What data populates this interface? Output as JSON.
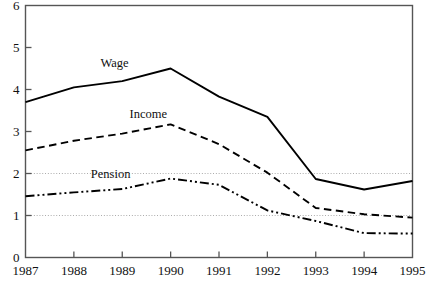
{
  "chart_data": {
    "type": "line",
    "title": "",
    "subtitle": "",
    "xlabel": "",
    "ylabel": "",
    "x": [
      1987,
      1988,
      1989,
      1990,
      1991,
      1992,
      1993,
      1994,
      1995
    ],
    "categories": [
      "1987",
      "1988",
      "1989",
      "1990",
      "1991",
      "1992",
      "1993",
      "1994",
      "1995"
    ],
    "xlim": [
      1987,
      1995
    ],
    "ylim": [
      0,
      6
    ],
    "yticks": [
      0,
      1,
      2,
      3,
      4,
      5,
      6
    ],
    "ytick_labels": [
      "0",
      "1",
      "2",
      "3",
      "4",
      "5",
      "6"
    ],
    "grid": "horizontal dotted gridlines at y=1 and y=2 only",
    "gridlines": [
      1,
      2
    ],
    "legend": "inline labels placed next to each curve",
    "legend_position": "inline",
    "series": [
      {
        "name": "Wage",
        "style": "solid",
        "color": "#000000",
        "values": [
          3.7,
          4.05,
          4.2,
          4.5,
          3.83,
          3.35,
          1.87,
          1.62,
          1.82
        ]
      },
      {
        "name": "Income",
        "style": "dashed",
        "color": "#000000",
        "values": [
          2.55,
          2.78,
          2.95,
          3.17,
          2.7,
          2.02,
          1.18,
          1.03,
          0.95
        ]
      },
      {
        "name": "Pension",
        "style": "dash-dot-dot",
        "color": "#000000",
        "values": [
          1.46,
          1.55,
          1.63,
          1.88,
          1.73,
          1.12,
          0.87,
          0.58,
          0.57
        ]
      }
    ],
    "annotations": [
      {
        "text": "Wage",
        "x": 1988.55,
        "y": 4.62
      },
      {
        "text": "Income",
        "x": 1989.15,
        "y": 3.42
      },
      {
        "text": "Pension",
        "x": 1988.35,
        "y": 1.98
      }
    ],
    "axis_color": "#555555",
    "series_color": "#000000",
    "grid_color": "#999999",
    "background": "#ffffff"
  }
}
